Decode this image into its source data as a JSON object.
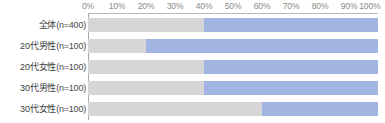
{
  "chart_data": {
    "type": "bar",
    "subtype": "stacked-horizontal-100",
    "title": "",
    "xlabel": "",
    "ylabel": "",
    "xlim": [
      0,
      100
    ],
    "grid": false,
    "legend": "none",
    "axis_ticks": [
      "0%",
      "10%",
      "20%",
      "30%",
      "40%",
      "50%",
      "60%",
      "70%",
      "80%",
      "90%",
      "100%"
    ],
    "axis_tick_values": [
      0,
      10,
      20,
      30,
      40,
      50,
      60,
      70,
      80,
      90,
      100
    ],
    "categories": [
      "全体（n=400）",
      "20代男性（n=100）",
      "20代女性（n=100）",
      "30代男性（n=100）",
      "30代女性（n=100）"
    ],
    "category_names": [
      "全体",
      "20代男性",
      "20代女性",
      "30代男性",
      "30代女性"
    ],
    "category_counts": [
      "(n=400)",
      "(n=100)",
      "(n=100)",
      "(n=100)",
      "(n=100)"
    ],
    "series": [
      {
        "name": "segment-1",
        "color": "#d6d6d6",
        "values": [
          40,
          20,
          40,
          40,
          60
        ]
      },
      {
        "name": "segment-2",
        "color": "#a2b4e2",
        "values": [
          60,
          80,
          60,
          60,
          40
        ]
      }
    ],
    "rows": [
      {
        "label_name": "全体",
        "label_count": "(n=400)",
        "gray": 40,
        "blue": 60
      },
      {
        "label_name": "20代男性",
        "label_count": "(n=100)",
        "gray": 20,
        "blue": 80
      },
      {
        "label_name": "20代女性",
        "label_count": "(n=100)",
        "gray": 40,
        "blue": 60
      },
      {
        "label_name": "30代男性",
        "label_count": "(n=100)",
        "gray": 40,
        "blue": 60
      },
      {
        "label_name": "30代女性",
        "label_count": "(n=100)",
        "gray": 60,
        "blue": 40
      }
    ],
    "colors": {
      "segment_gray": "#d6d6d6",
      "segment_blue": "#a2b4e2",
      "axis_line": "#a8a8a8",
      "tick_text": "#8a8a8a",
      "label_text": "#3d3d3d",
      "background": "#ffffff"
    }
  }
}
